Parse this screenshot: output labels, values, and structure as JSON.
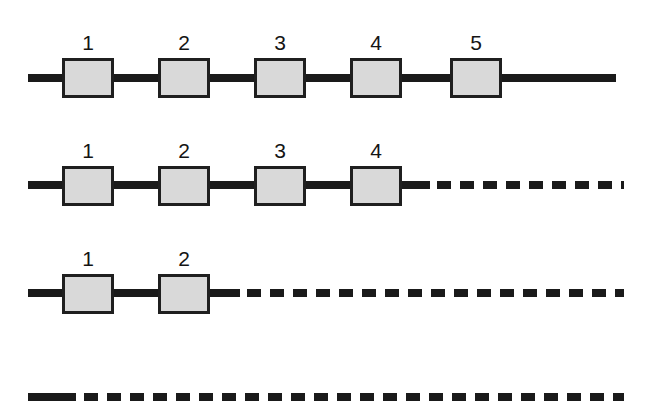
{
  "figure": {
    "title": "",
    "background_color": "#ffffff",
    "line_color": "#1a1a1a",
    "box_fill_color": "#d9d9d9",
    "box_border_color": "#1f1f1f",
    "label_color": "#141414",
    "line_thickness": 8,
    "box_width": 52,
    "box_height": 40,
    "box_border_width": 3,
    "dash_length": 14,
    "dash_gap": 9
  },
  "rows": [
    {
      "id": "row-1",
      "line_y": 78,
      "box_top": 58,
      "label_y": 50,
      "solid_start_x": 28,
      "solid_end_x": 616,
      "dashed_start_x": null,
      "dashed_end_x": null,
      "boxes": [
        {
          "label": "1",
          "x": 62
        },
        {
          "label": "2",
          "x": 158
        },
        {
          "label": "3",
          "x": 254
        },
        {
          "label": "4",
          "x": 350
        },
        {
          "label": "5",
          "x": 450
        }
      ]
    },
    {
      "id": "row-2",
      "line_y": 185,
      "box_top": 166,
      "label_y": 158,
      "solid_start_x": 28,
      "solid_end_x": 430,
      "dashed_start_x": 437,
      "dashed_end_x": 624,
      "boxes": [
        {
          "label": "1",
          "x": 62
        },
        {
          "label": "2",
          "x": 158
        },
        {
          "label": "3",
          "x": 254
        },
        {
          "label": "4",
          "x": 350
        }
      ]
    },
    {
      "id": "row-3",
      "line_y": 293,
      "box_top": 274,
      "label_y": 266,
      "solid_start_x": 28,
      "solid_end_x": 240,
      "dashed_start_x": 247,
      "dashed_end_x": 624,
      "boxes": [
        {
          "label": "1",
          "x": 62
        },
        {
          "label": "2",
          "x": 158
        }
      ]
    },
    {
      "id": "row-4",
      "line_y": 397,
      "box_top": null,
      "label_y": null,
      "solid_start_x": 28,
      "solid_end_x": 76,
      "dashed_start_x": 84,
      "dashed_end_x": 624,
      "boxes": []
    }
  ]
}
